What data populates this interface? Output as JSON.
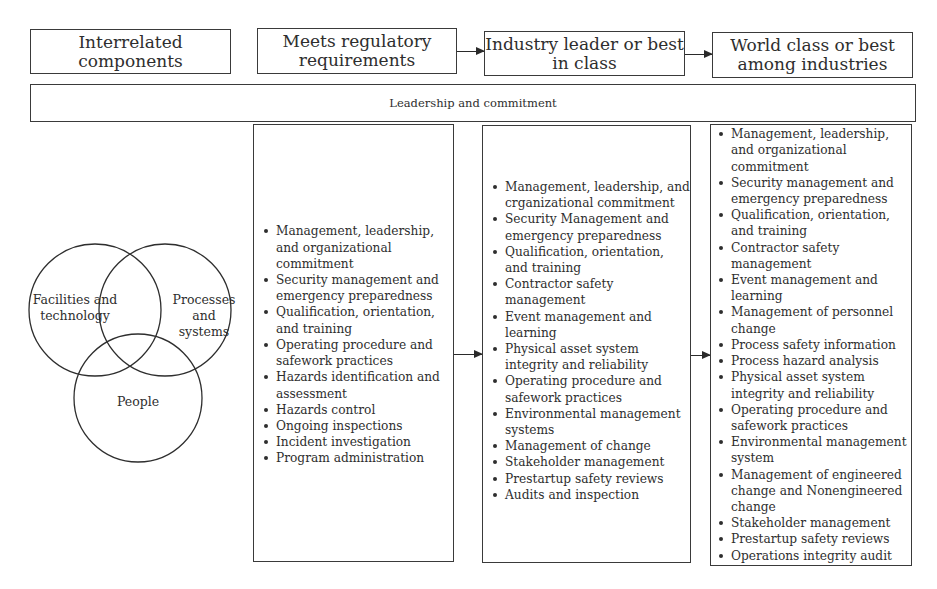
{
  "header": {
    "interrelated": "Interrelated components",
    "stage1": {
      "line1": "Meets regulatory",
      "line2": "requirements"
    },
    "stage2": {
      "line1": "Industry leader or best",
      "line2": "in class"
    },
    "stage3": {
      "line1": "World class or best",
      "line2": "among industries"
    }
  },
  "leadership_bar": "Leadership and commitment",
  "venn": {
    "circles": [
      {
        "label_line1": "Facilities and",
        "label_line2": "technology"
      },
      {
        "label_line1": "Processes and",
        "label_line2": "systems"
      },
      {
        "label_line1": "People",
        "label_line2": ""
      }
    ]
  },
  "columns": {
    "regulatory": [
      "Management, leadership, and organizational commitment",
      "Security management and emergency preparedness",
      "Qualification, orientation, and training",
      "Operating procedure and safework practices",
      "Hazards identification and assessment",
      "Hazards control",
      "Ongoing inspections",
      "Incident investigation",
      "Program administration"
    ],
    "industry_leader": [
      "Management, leadership, and crganizational commitment",
      "Security Management and emergency preparedness",
      "Qualification, orientation, and training",
      "Contractor safety management",
      "Event management and learning",
      "Physical asset system integrity and reliability",
      "Operating procedure and safework practices",
      "Environmental management systems",
      "Management of change",
      "Stakeholder management",
      "Prestartup safety reviews",
      "Audits and inspection"
    ],
    "world_class": [
      "Management, leadership, and organizational commitment",
      "Security management and emergency preparedness",
      "Qualification, orientation, and training",
      "Contractor safety management",
      "Event management and learning",
      "Management of personnel change",
      "Process safety information",
      "Process hazard analysis",
      "Physical asset system integrity and reliability",
      "Operating procedure and safework practices",
      "Environmental management system",
      "Management of engineered change and Nonengineered change",
      "Stakeholder management",
      "Prestartup safety reviews",
      "Operations integrity audit"
    ]
  },
  "colors": {
    "line": "#3a3a3a",
    "text": "#2e2e2e",
    "background": "#ffffff"
  }
}
